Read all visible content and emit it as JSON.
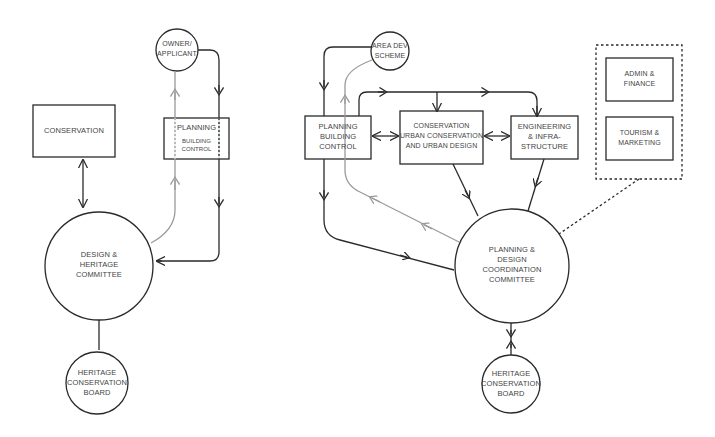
{
  "diagram": {
    "left": {
      "conservation": "CONSERVATION",
      "owner": [
        "OWNER/",
        "APPLICANT"
      ],
      "planning": "PLANNING",
      "building_control": [
        "BUILDING",
        "CONTROL"
      ],
      "committee": [
        "DESIGN &",
        "HERITAGE",
        "COMMITTEE"
      ],
      "board": [
        "HERITAGE",
        "CONSERVATION",
        "BOARD"
      ]
    },
    "right": {
      "area_dev": [
        "AREA DEV",
        "SCHEME"
      ],
      "planning_bc": [
        "PLANNING",
        "BUILDING",
        "CONTROL"
      ],
      "conservation": [
        "CONSERVATION",
        "URBAN CONSERVATION",
        "AND URBAN DESIGN"
      ],
      "engineering": [
        "ENGINEERING",
        "& INFRA-",
        "STRUCTURE"
      ],
      "admin": [
        "ADMIN &",
        "FINANCE"
      ],
      "tourism": [
        "TOURISM &",
        "MARKETING"
      ],
      "committee": [
        "PLANNING &",
        "DESIGN",
        "COORDINATION",
        "COMMITTEE"
      ],
      "board": [
        "HERITAGE",
        "CONSERVATION",
        "BOARD"
      ]
    },
    "colors": {
      "line": "#2a2a2a",
      "secondary": "#9a9a9a",
      "text": "#444444"
    }
  }
}
